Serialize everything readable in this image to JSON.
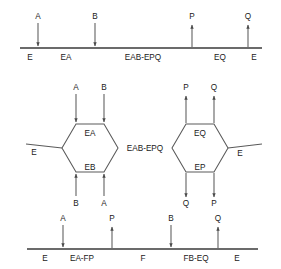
{
  "diagram": {
    "type": "reaction-mechanism-schematic",
    "title": "",
    "stroke_color": "#5a5a5a",
    "axis_color": "#3a3a3a",
    "background": "#ffffff",
    "panels": [
      {
        "id": "top-linear-scheme",
        "kind": "linear-axis",
        "axis": {
          "x1": 20,
          "x2": 262,
          "y": 48
        },
        "states": [
          {
            "label": "E",
            "x": 30
          },
          {
            "label": "EA",
            "x": 66
          },
          {
            "label": "EAB-EPQ",
            "x": 143
          },
          {
            "label": "EQ",
            "x": 220
          },
          {
            "label": "E",
            "x": 254
          }
        ],
        "fluxes": [
          {
            "label": "A",
            "x": 38,
            "direction": "down"
          },
          {
            "label": "B",
            "x": 95,
            "direction": "down"
          },
          {
            "label": "P",
            "x": 192,
            "direction": "up"
          },
          {
            "label": "Q",
            "x": 248,
            "direction": "up"
          }
        ]
      },
      {
        "id": "middle-hexagon-scheme",
        "kind": "hexagon-pair",
        "connector_label": "EAB-EPQ",
        "left_hexagon": {
          "top_label": "EB",
          "bottom_label": "EA",
          "inner_top_label": "EA",
          "inner_bottom_label": "EB",
          "side_label": "E",
          "side": "left",
          "top_fluxes": [
            {
              "label": "A",
              "direction": "down"
            },
            {
              "label": "B",
              "direction": "down"
            }
          ],
          "bottom_fluxes": [
            {
              "label": "B",
              "direction": "up"
            },
            {
              "label": "A",
              "direction": "up"
            }
          ]
        },
        "right_hexagon": {
          "inner_top_label": "EQ",
          "inner_bottom_label": "EP",
          "side_label": "E",
          "side": "right",
          "top_fluxes": [
            {
              "label": "P",
              "direction": "up"
            },
            {
              "label": "Q",
              "direction": "up"
            }
          ],
          "bottom_fluxes": [
            {
              "label": "Q",
              "direction": "down"
            },
            {
              "label": "P",
              "direction": "down"
            }
          ]
        }
      },
      {
        "id": "bottom-linear-scheme",
        "kind": "linear-axis",
        "axis": {
          "x1": 27,
          "x2": 258,
          "y": 249
        },
        "states": [
          {
            "label": "E",
            "x": 45
          },
          {
            "label": "EA-FP",
            "x": 82
          },
          {
            "label": "F",
            "x": 143
          },
          {
            "label": "FB-EQ",
            "x": 196
          },
          {
            "label": "E",
            "x": 237
          }
        ],
        "fluxes": [
          {
            "label": "A",
            "x": 63,
            "direction": "down"
          },
          {
            "label": "P",
            "x": 112,
            "direction": "up"
          },
          {
            "label": "B",
            "x": 171,
            "direction": "down"
          },
          {
            "label": "Q",
            "x": 218,
            "direction": "up"
          }
        ]
      }
    ]
  },
  "labels": {
    "E": "E",
    "F": "F",
    "A": "A",
    "B": "B",
    "P": "P",
    "Q": "Q",
    "EA": "EA",
    "EB": "EB",
    "EP": "EP",
    "EQ": "EQ",
    "EAB_EPQ": "EAB-EPQ",
    "EA_FP": "EA-FP",
    "FB_EQ": "FB-EQ"
  }
}
